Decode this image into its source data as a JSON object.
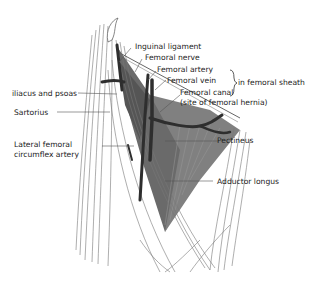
{
  "diagram": {
    "labels": {
      "inguinal_ligament": "Inguinal ligament",
      "femoral_nerve": "Femoral nerve",
      "femoral_artery": "Femoral artery",
      "femoral_vein": "Femoral vein",
      "femoral_canal": "Femoral canal",
      "femoral_canal_note": "(site of femoral hernia)",
      "in_femoral_sheath": "in femoral sheath",
      "iliacus_psoas": "iliacus and psoas",
      "sartorius": "Sartorius",
      "lateral_femoral_1": "Lateral femoral",
      "lateral_femoral_2": "circumflex artery",
      "pectineus": "Pectineus",
      "adductor_longus": "Adductor longus"
    },
    "colors": {
      "muscle_dark": "#5a5a5a",
      "muscle_mid": "#7a7a7a",
      "vessel": "#2e2e2e",
      "line": "#555555",
      "text": "#222222"
    }
  }
}
